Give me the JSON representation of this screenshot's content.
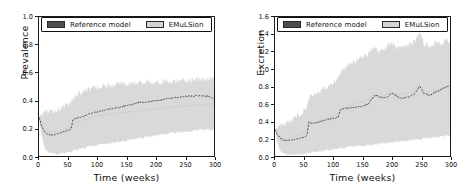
{
  "figure": {
    "background": "#ffffff",
    "panel_count": 2
  },
  "legend": {
    "entries": [
      {
        "label": "Reference model",
        "color": "#4d4d4d",
        "name": "reference-model"
      },
      {
        "label": "EMuLSion",
        "color": "#d4d4d4",
        "name": "emulsion"
      }
    ]
  },
  "chart_data": [
    {
      "type": "line",
      "title": "",
      "panel": "left",
      "xlabel": "Time (weeks)",
      "ylabel": "Prevalence",
      "xlim": [
        0,
        300
      ],
      "ylim": [
        0.0,
        1.0
      ],
      "xticks": [
        0,
        50,
        100,
        150,
        200,
        250,
        300
      ],
      "yticks": [
        "0.0",
        "0.2",
        "0.4",
        "0.6",
        "0.8",
        "1.0"
      ],
      "xtick_labels": [
        "0",
        "50",
        "100",
        "150",
        "200",
        "250",
        "300"
      ],
      "grid": false,
      "legend_position": "upper-left",
      "series": [
        {
          "name": "Reference model",
          "style": "dashed-line",
          "color": "#3a3a3a",
          "x": [
            0,
            5,
            10,
            15,
            20,
            25,
            30,
            35,
            40,
            45,
            50,
            55,
            58,
            60,
            65,
            70,
            75,
            80,
            85,
            90,
            95,
            100,
            110,
            120,
            130,
            140,
            150,
            160,
            170,
            180,
            190,
            200,
            210,
            220,
            230,
            240,
            250,
            260,
            270,
            280,
            290,
            300
          ],
          "values": [
            0.28,
            0.21,
            0.17,
            0.155,
            0.15,
            0.152,
            0.158,
            0.165,
            0.172,
            0.178,
            0.185,
            0.195,
            0.255,
            0.265,
            0.272,
            0.278,
            0.285,
            0.292,
            0.3,
            0.305,
            0.312,
            0.318,
            0.328,
            0.338,
            0.345,
            0.352,
            0.362,
            0.372,
            0.385,
            0.388,
            0.392,
            0.398,
            0.405,
            0.412,
            0.418,
            0.422,
            0.428,
            0.43,
            0.432,
            0.433,
            0.43,
            0.412
          ]
        },
        {
          "name": "EMuLSion",
          "style": "band",
          "color": "#d9d9d9",
          "x": [
            0,
            5,
            10,
            15,
            20,
            25,
            30,
            35,
            40,
            45,
            50,
            55,
            58,
            60,
            65,
            70,
            75,
            80,
            85,
            90,
            95,
            100,
            110,
            120,
            130,
            140,
            150,
            160,
            170,
            180,
            190,
            200,
            210,
            220,
            230,
            240,
            250,
            260,
            270,
            280,
            290,
            300
          ],
          "lower": [
            0.28,
            0.13,
            0.06,
            0.03,
            0.02,
            0.015,
            0.015,
            0.018,
            0.02,
            0.022,
            0.025,
            0.028,
            0.035,
            0.04,
            0.045,
            0.05,
            0.055,
            0.06,
            0.065,
            0.07,
            0.075,
            0.078,
            0.085,
            0.09,
            0.098,
            0.105,
            0.112,
            0.12,
            0.128,
            0.135,
            0.14,
            0.148,
            0.155,
            0.16,
            0.165,
            0.17,
            0.175,
            0.18,
            0.185,
            0.188,
            0.19,
            0.19
          ],
          "upper": [
            0.28,
            0.3,
            0.31,
            0.315,
            0.32,
            0.325,
            0.33,
            0.34,
            0.352,
            0.365,
            0.378,
            0.39,
            0.415,
            0.425,
            0.44,
            0.452,
            0.462,
            0.47,
            0.478,
            0.485,
            0.49,
            0.495,
            0.5,
            0.508,
            0.512,
            0.515,
            0.52,
            0.522,
            0.525,
            0.528,
            0.53,
            0.532,
            0.535,
            0.538,
            0.54,
            0.542,
            0.545,
            0.545,
            0.548,
            0.55,
            0.552,
            0.555
          ]
        }
      ]
    },
    {
      "type": "line",
      "title": "",
      "panel": "right",
      "xlabel": "Time (weeks)",
      "ylabel": "Excretion",
      "xlim": [
        0,
        300
      ],
      "ylim": [
        0.0,
        1.6
      ],
      "xticks": [
        0,
        50,
        100,
        150,
        200,
        250,
        300
      ],
      "yticks": [
        "0.0",
        "0.2",
        "0.4",
        "0.6",
        "0.8",
        "1.0",
        "1.2",
        "1.4",
        "1.6"
      ],
      "xtick_labels": [
        "0",
        "50",
        "100",
        "150",
        "200",
        "250",
        "300"
      ],
      "grid": false,
      "legend_position": "upper-left",
      "series": [
        {
          "name": "Reference model",
          "style": "dashed-line",
          "color": "#3a3a3a",
          "x": [
            0,
            5,
            10,
            15,
            20,
            25,
            30,
            35,
            40,
            45,
            50,
            55,
            58,
            62,
            70,
            80,
            90,
            100,
            108,
            112,
            116,
            120,
            130,
            140,
            150,
            160,
            170,
            175,
            180,
            190,
            200,
            210,
            220,
            230,
            240,
            248,
            255,
            265,
            275,
            285,
            295,
            300
          ],
          "values": [
            0.3,
            0.24,
            0.2,
            0.185,
            0.18,
            0.182,
            0.19,
            0.195,
            0.2,
            0.205,
            0.215,
            0.245,
            0.4,
            0.375,
            0.385,
            0.4,
            0.42,
            0.43,
            0.445,
            0.53,
            0.545,
            0.55,
            0.555,
            0.565,
            0.575,
            0.6,
            0.69,
            0.7,
            0.68,
            0.665,
            0.725,
            0.68,
            0.665,
            0.68,
            0.72,
            0.81,
            0.72,
            0.7,
            0.735,
            0.77,
            0.8,
            0.81
          ]
        },
        {
          "name": "EMuLSion",
          "style": "band",
          "color": "#d9d9d9",
          "x": [
            0,
            5,
            10,
            15,
            20,
            25,
            30,
            35,
            40,
            45,
            50,
            55,
            58,
            62,
            70,
            80,
            90,
            100,
            108,
            112,
            116,
            120,
            130,
            140,
            150,
            160,
            170,
            175,
            180,
            190,
            200,
            210,
            220,
            230,
            240,
            248,
            255,
            265,
            275,
            285,
            295,
            300
          ],
          "lower": [
            0.3,
            0.12,
            0.05,
            0.025,
            0.018,
            0.015,
            0.015,
            0.018,
            0.02,
            0.022,
            0.025,
            0.03,
            0.04,
            0.045,
            0.05,
            0.06,
            0.07,
            0.078,
            0.085,
            0.09,
            0.095,
            0.1,
            0.108,
            0.115,
            0.12,
            0.128,
            0.135,
            0.14,
            0.145,
            0.152,
            0.16,
            0.165,
            0.172,
            0.18,
            0.188,
            0.195,
            0.2,
            0.21,
            0.218,
            0.225,
            0.232,
            0.24
          ],
          "upper": [
            0.3,
            0.33,
            0.35,
            0.37,
            0.385,
            0.4,
            0.42,
            0.44,
            0.47,
            0.5,
            0.53,
            0.57,
            0.66,
            0.69,
            0.72,
            0.76,
            0.8,
            0.84,
            0.9,
            0.96,
            1.0,
            1.02,
            1.06,
            1.1,
            1.14,
            1.18,
            1.27,
            1.22,
            1.2,
            1.26,
            1.3,
            1.24,
            1.26,
            1.28,
            1.32,
            1.45,
            1.3,
            1.26,
            1.31,
            1.28,
            1.34,
            1.3
          ]
        }
      ]
    }
  ]
}
